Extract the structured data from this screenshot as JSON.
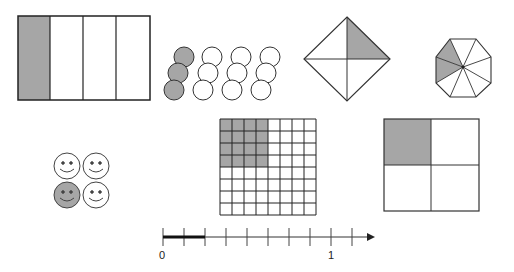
{
  "colors": {
    "shade": "#a6a6a6",
    "stroke": "#222222",
    "fill": "#ffffff"
  },
  "figures": [
    {
      "id": "rectangle-strips",
      "type": "rectangle divided into vertical strips",
      "parts": 4,
      "shaded": 1,
      "fraction": "1/4"
    },
    {
      "id": "circle-set",
      "type": "set of circles in 4 groups",
      "groups": 4,
      "per_group": 3,
      "shaded_group": 1,
      "fraction": "1/4"
    },
    {
      "id": "diamond",
      "type": "square rotated 45° split by diagonals",
      "parts": 4,
      "shaded": 1,
      "fraction": "1/4"
    },
    {
      "id": "octagon",
      "type": "regular octagon split into sectors",
      "parts": 8,
      "shaded": 2,
      "fraction": "2/8"
    },
    {
      "id": "smiley-faces",
      "type": "set of smiley faces",
      "count": 4,
      "shaded": 1,
      "fraction": "1/4"
    },
    {
      "id": "grid",
      "type": "square grid",
      "rows": 8,
      "cols": 8,
      "shaded_rows": 4,
      "shaded_cols": 4,
      "fraction": "16/64"
    },
    {
      "id": "quad-square",
      "type": "square split into quadrants",
      "parts": 4,
      "shaded": 1,
      "fraction": "1/4"
    }
  ],
  "number_line": {
    "labels": {
      "zero": "0",
      "one": "1"
    },
    "intervals_per_unit": 8,
    "extra_ticks": 1,
    "highlighted_from": 0,
    "highlighted_to_ticks": 2,
    "arrow": "right"
  }
}
